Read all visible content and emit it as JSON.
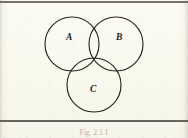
{
  "figure": {
    "kind": "venn-diagram",
    "title": "",
    "caption": "Fig. 2.1.1",
    "background_color": "#faf9ef",
    "stroke_color": "#25241f",
    "label_color": "#1d1c18",
    "rule_color": "#52504a"
  },
  "diagram": {
    "type": "three-set-venn",
    "radius": 27,
    "sets": [
      {
        "id": "A",
        "label": "A",
        "cx": 72,
        "cy": 44,
        "label_x": 69,
        "label_y": 38
      },
      {
        "id": "B",
        "label": "B",
        "cx": 116,
        "cy": 44,
        "label_x": 119,
        "label_y": 38
      },
      {
        "id": "C",
        "label": "C",
        "cx": 94,
        "cy": 85,
        "label_x": 93,
        "label_y": 90
      }
    ]
  },
  "rules": {
    "top_label": "top-frame-rule",
    "bottom_label": "bottom-frame-rule"
  }
}
